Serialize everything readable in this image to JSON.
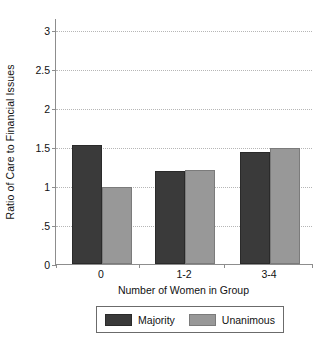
{
  "chart_data": {
    "type": "bar",
    "title": "",
    "subtitle": "",
    "xlabel": "Number of Women in Group",
    "ylabel": "Ratio of Care to Financial Issues",
    "categories": [
      "0",
      "1-2",
      "3-4"
    ],
    "series": [
      {
        "name": "Majority",
        "color": "#3a3a3a",
        "values": [
          1.52,
          1.19,
          1.43
        ]
      },
      {
        "name": "Unanimous",
        "color": "#989898",
        "values": [
          0.99,
          1.21,
          1.48
        ]
      }
    ],
    "ylim": [
      0,
      3.15
    ],
    "yticks": [
      0,
      0.5,
      1,
      1.5,
      2,
      2.5,
      3
    ],
    "ytick_labels": [
      "0",
      ".5",
      "1",
      "1.5",
      "2",
      "2.5",
      "3"
    ],
    "grid": true,
    "grid_axis": "y",
    "legend_position": "bottom",
    "legend_entries": [
      "Majority",
      "Unanimous"
    ]
  }
}
